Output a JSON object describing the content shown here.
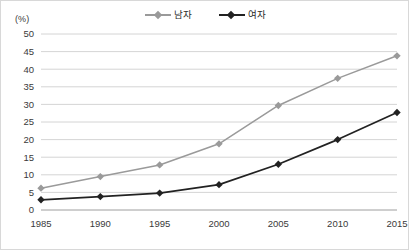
{
  "chart_data": {
    "type": "line",
    "title": "",
    "subtitle": "",
    "xlabel": "",
    "ylabel": "",
    "unit_label": "(%)",
    "categories": [
      "1985",
      "1990",
      "1995",
      "2000",
      "2005",
      "2010",
      "2015"
    ],
    "x": [
      1985,
      1990,
      1995,
      2000,
      2005,
      2010,
      2015
    ],
    "series": [
      {
        "name": "남자",
        "color": "#9a9a9a",
        "marker": "diamond",
        "values": [
          6.2,
          9.5,
          12.8,
          18.8,
          29.7,
          37.4,
          43.8
        ]
      },
      {
        "name": "여자",
        "color": "#222222",
        "marker": "diamond",
        "values": [
          2.9,
          3.8,
          4.8,
          7.2,
          13.0,
          20.0,
          27.7
        ]
      }
    ],
    "ylim": [
      0,
      50
    ],
    "yticks": [
      0,
      5,
      10,
      15,
      20,
      25,
      30,
      35,
      40,
      45,
      50
    ],
    "ytick_labels": [
      "0",
      "5",
      "10",
      "15",
      "20",
      "25",
      "30",
      "35",
      "40",
      "45",
      "50"
    ],
    "grid": {
      "horizontal": true,
      "vertical": false,
      "color": "#c9c9c9"
    },
    "legend": {
      "position": "top-center",
      "entries": [
        "남자",
        "여자"
      ]
    },
    "axis": {
      "baseline_color": "#9e9e9e"
    },
    "border_color": "#d8d8d8"
  }
}
